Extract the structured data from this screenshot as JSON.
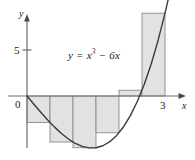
{
  "figure": {
    "background_color": "#ffffff",
    "axis_color": "#6e6e6e",
    "curve_color": "#3a3a3a",
    "rect_fill": "#e2e2e2",
    "rect_stroke": "#8a8a8a"
  },
  "axes": {
    "y_axis_label": "y",
    "x_axis_label": "x",
    "origin_label": "0",
    "y_ticks": [
      {
        "value": 5,
        "label": "5"
      }
    ],
    "x_ticks": [
      {
        "value": 3,
        "label": "3"
      }
    ]
  },
  "equation": {
    "lhs": "y",
    "equals": "=",
    "base": "x",
    "exponent": "3",
    "rest": "− 6x",
    "full_text": "y = x³ − 6x"
  },
  "chart_data": {
    "type": "area",
    "xlabel": "x",
    "ylabel": "y",
    "xlim": [
      -0.35,
      3.45
    ],
    "ylim": [
      -7.2,
      11.0
    ],
    "grid": false,
    "legend": "none",
    "function": "y = x^3 - 6x",
    "curve": {
      "name": "y = x³ − 6x",
      "x": [
        0,
        0.15,
        0.3,
        0.45,
        0.6,
        0.75,
        0.9,
        1.05,
        1.2,
        1.35,
        1.5,
        1.65,
        1.8,
        1.95,
        2.1,
        2.25,
        2.4,
        2.55,
        2.7,
        2.85,
        3
      ],
      "y": [
        0,
        -0.8966,
        -2.4,
        -3.6089,
        -4.384,
        -4.9781,
        -5.1711,
        -5.1424,
        -4.9728,
        -4.6399,
        -4.125,
        -3.4076,
        -2.4672,
        -1.2834,
        0.1641,
        1.8984,
        3.924,
        6.2824,
        8.983,
        12.0521,
        9
      ]
    },
    "rectangles": {
      "count": 6,
      "interval": [
        0,
        3
      ],
      "width": 0.5,
      "method": "right-endpoint",
      "bars": [
        {
          "x_left": 0.0,
          "x_right": 0.5,
          "height": -2.875
        },
        {
          "x_left": 0.5,
          "x_right": 1.0,
          "height": -5.0
        },
        {
          "x_left": 1.0,
          "x_right": 1.5,
          "height": -5.625
        },
        {
          "x_left": 1.5,
          "x_right": 2.0,
          "height": -4.0
        },
        {
          "x_left": 2.0,
          "x_right": 2.5,
          "height": 0.625
        },
        {
          "x_left": 2.5,
          "x_right": 3.0,
          "height": 9.0
        }
      ]
    }
  }
}
